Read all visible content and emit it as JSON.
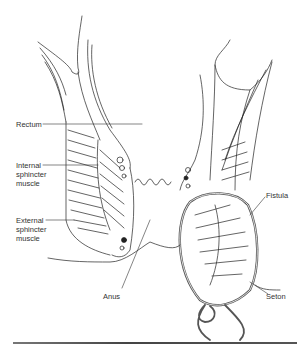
{
  "diagram": {
    "labels": {
      "rectum": "Rectum",
      "internal_sphincter": "Internal\nsphincter\nmuscle",
      "external_sphincter": "External\nsphincter\nmuscle",
      "anus": "Anus",
      "fistula": "Fistula",
      "seton": "Seton"
    },
    "colors": {
      "line": "#222222",
      "label_text": "#333333",
      "seton": "#555555",
      "background": "#ffffff"
    }
  }
}
